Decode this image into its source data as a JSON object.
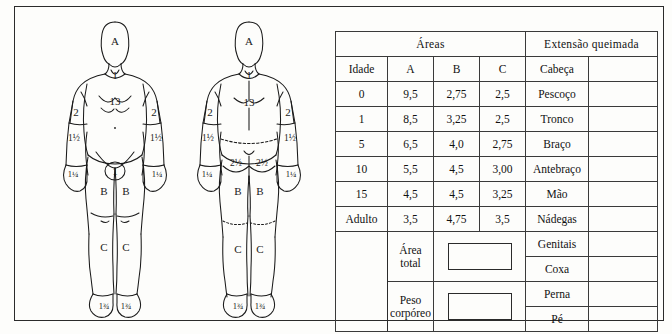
{
  "document": {
    "kind": "lund-browder-burn-chart",
    "language": "pt-BR"
  },
  "figures": {
    "anterior": {
      "name": "anterior-body-diagram",
      "labels": [
        {
          "id": "head-a",
          "text": "A"
        },
        {
          "id": "neck-1",
          "text": "1"
        },
        {
          "id": "trunk-13",
          "text": "13"
        },
        {
          "id": "upper-arm-left-2",
          "text": "2"
        },
        {
          "id": "upper-arm-right-2",
          "text": "2"
        },
        {
          "id": "forearm-left",
          "text": "1½"
        },
        {
          "id": "forearm-right",
          "text": "1½"
        },
        {
          "id": "hand-left",
          "text": "1¼"
        },
        {
          "id": "hand-right",
          "text": "1¼"
        },
        {
          "id": "genitals-1",
          "text": "1"
        },
        {
          "id": "thigh-left-b",
          "text": "B"
        },
        {
          "id": "thigh-right-b",
          "text": "B"
        },
        {
          "id": "leg-left-c",
          "text": "C"
        },
        {
          "id": "leg-right-c",
          "text": "C"
        },
        {
          "id": "foot-left",
          "text": "1¾"
        },
        {
          "id": "foot-right",
          "text": "1¾"
        }
      ]
    },
    "posterior": {
      "name": "posterior-body-diagram",
      "labels": [
        {
          "id": "head-a",
          "text": "A"
        },
        {
          "id": "neck-1",
          "text": "1"
        },
        {
          "id": "back-13",
          "text": "13"
        },
        {
          "id": "upper-arm-left-2",
          "text": "2"
        },
        {
          "id": "upper-arm-right-2",
          "text": "2"
        },
        {
          "id": "forearm-left",
          "text": "1½"
        },
        {
          "id": "forearm-right",
          "text": "1½"
        },
        {
          "id": "hand-left",
          "text": "1¼"
        },
        {
          "id": "hand-right",
          "text": "1¼"
        },
        {
          "id": "buttock-left",
          "text": "2½"
        },
        {
          "id": "buttock-right",
          "text": "2½"
        },
        {
          "id": "thigh-left-b",
          "text": "B"
        },
        {
          "id": "thigh-right-b",
          "text": "B"
        },
        {
          "id": "leg-left-c",
          "text": "C"
        },
        {
          "id": "leg-right-c",
          "text": "C"
        },
        {
          "id": "foot-left",
          "text": "1¾"
        },
        {
          "id": "foot-right",
          "text": "1¾"
        }
      ]
    }
  },
  "table": {
    "group_headers": {
      "areas": "Áreas",
      "extent": "Extensão queimada"
    },
    "columns": [
      "Idade",
      "A",
      "B",
      "C"
    ],
    "rows": [
      {
        "idade": "0",
        "A": "9,5",
        "B": "2,75",
        "C": "2,5"
      },
      {
        "idade": "1",
        "A": "8,5",
        "B": "3,25",
        "C": "2,5"
      },
      {
        "idade": "5",
        "A": "6,5",
        "B": "4,0",
        "C": "2,75"
      },
      {
        "idade": "10",
        "A": "5,5",
        "B": "4,5",
        "C": "3,00"
      },
      {
        "idade": "15",
        "A": "4,5",
        "B": "4,5",
        "C": "3,25"
      },
      {
        "idade": "Adulto",
        "A": "3,5",
        "B": "4,75",
        "C": "3,5"
      }
    ],
    "body_parts": [
      {
        "name": "Cabeça",
        "value": ""
      },
      {
        "name": "Pescoço",
        "value": ""
      },
      {
        "name": "Tronco",
        "value": ""
      },
      {
        "name": "Braço",
        "value": ""
      },
      {
        "name": "Antebraço",
        "value": ""
      },
      {
        "name": "Mão",
        "value": ""
      },
      {
        "name": "Nádegas",
        "value": ""
      },
      {
        "name": "Genitais",
        "value": ""
      },
      {
        "name": "Coxa",
        "value": ""
      },
      {
        "name": "Perna",
        "value": ""
      },
      {
        "name": "Pé",
        "value": ""
      }
    ],
    "calc": {
      "area_total_label_line1": "Área",
      "area_total_label_line2": "total",
      "area_total_value": "",
      "peso_label_line1": "Peso",
      "peso_label_line2": "corpóreo",
      "peso_value": ""
    }
  },
  "colors": {
    "ink": "#1a1a1a",
    "rule": "#3a3a3a",
    "frame": "#2b2b2b",
    "paper": "#fdfdfb"
  }
}
